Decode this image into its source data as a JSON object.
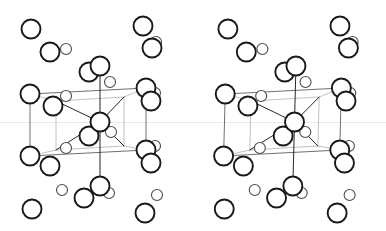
{
  "figure": {
    "width": 386,
    "height": 231,
    "background_color": "#ffffff",
    "line_color": "#1a1a1a",
    "faint_line_color": "#b9b9c2",
    "atom_fill": "#ffffff",
    "atom_stroke": "#1a1a1a"
  },
  "panes": [
    {
      "name": "left-stereo-view",
      "label": "Left eye view",
      "offset_x": 0,
      "offset_y": 0,
      "shear": 0
    },
    {
      "name": "right-stereo-view",
      "label": "Right eye view",
      "offset_x": 193,
      "offset_y": 0,
      "shear": 1
    }
  ],
  "cell": {
    "name": "unit-cell-box",
    "front_face": [
      [
        30,
        94
      ],
      [
        146,
        88
      ],
      [
        146,
        150
      ],
      [
        30,
        156
      ]
    ],
    "back_face": [
      [
        56,
        101
      ],
      [
        124,
        97
      ],
      [
        124,
        146
      ],
      [
        56,
        150
      ]
    ],
    "edges_strong": [
      [
        30,
        94,
        146,
        88
      ],
      [
        30,
        156,
        146,
        150
      ],
      [
        30,
        94,
        30,
        156
      ],
      [
        146,
        88,
        146,
        150
      ]
    ],
    "edges_faint": [
      [
        56,
        101,
        124,
        97
      ],
      [
        56,
        150,
        124,
        146
      ],
      [
        56,
        101,
        56,
        150
      ],
      [
        124,
        97,
        124,
        146
      ],
      [
        30,
        94,
        56,
        101
      ],
      [
        146,
        88,
        124,
        97
      ],
      [
        30,
        156,
        56,
        150
      ],
      [
        146,
        150,
        124,
        146
      ]
    ]
  },
  "bonds": {
    "name": "bond-lines",
    "center": [
      100,
      122
    ],
    "segments": [
      [
        100,
        122,
        56,
        101
      ],
      [
        100,
        122,
        124,
        97
      ],
      [
        100,
        122,
        56,
        150
      ],
      [
        100,
        122,
        124,
        146
      ],
      [
        100,
        122,
        100,
        60
      ],
      [
        100,
        122,
        100,
        186
      ],
      [
        100,
        122,
        88,
        136
      ],
      [
        100,
        122,
        111,
        132
      ]
    ]
  },
  "atoms": {
    "large_radius": 9.5,
    "small_radius": 5.5,
    "large_stroke": 1.9,
    "small_stroke": 1.1,
    "large": [
      {
        "cx": 30,
        "cy": 94,
        "name": "atom-cell-corner-top-left"
      },
      {
        "cx": 146,
        "cy": 88,
        "name": "atom-cell-corner-top-right"
      },
      {
        "cx": 30,
        "cy": 156,
        "name": "atom-cell-corner-bottom-left"
      },
      {
        "cx": 146,
        "cy": 150,
        "name": "atom-cell-corner-bottom-right"
      },
      {
        "cx": 151,
        "cy": 101,
        "name": "atom-right-upper-outer"
      },
      {
        "cx": 151,
        "cy": 163,
        "name": "atom-right-lower-outer"
      },
      {
        "cx": 89,
        "cy": 72,
        "name": "atom-top-cap-left"
      },
      {
        "cx": 100,
        "cy": 66,
        "name": "atom-top-cap-right"
      },
      {
        "cx": 89,
        "cy": 136,
        "name": "atom-interior-lower-left"
      },
      {
        "cx": 100,
        "cy": 122,
        "name": "atom-cell-center"
      },
      {
        "cx": 53,
        "cy": 106,
        "name": "atom-interior-upper-left"
      },
      {
        "cx": 50,
        "cy": 166,
        "name": "atom-below-bottom-left"
      },
      {
        "cx": 100,
        "cy": 186,
        "name": "atom-bottom-stem"
      },
      {
        "cx": 84,
        "cy": 198,
        "name": "atom-bottom-left-free"
      },
      {
        "cx": 31,
        "cy": 29,
        "name": "atom-free-upper-left-1"
      },
      {
        "cx": 50,
        "cy": 52,
        "name": "atom-free-upper-left-2"
      },
      {
        "cx": 143,
        "cy": 26,
        "name": "atom-free-upper-right-1"
      },
      {
        "cx": 152,
        "cy": 48,
        "name": "atom-free-upper-right-2"
      },
      {
        "cx": 32,
        "cy": 209,
        "name": "atom-free-lower-left-1"
      },
      {
        "cx": 145,
        "cy": 213,
        "name": "atom-free-lower-right-1"
      }
    ],
    "small": [
      {
        "cx": 66,
        "cy": 49,
        "name": "atom-small-upper-left"
      },
      {
        "cx": 156,
        "cy": 42,
        "name": "atom-small-upper-right"
      },
      {
        "cx": 110,
        "cy": 82,
        "name": "atom-small-top-inner"
      },
      {
        "cx": 66,
        "cy": 96,
        "name": "atom-small-back-top-left"
      },
      {
        "cx": 155,
        "cy": 93,
        "name": "atom-small-back-top-right"
      },
      {
        "cx": 111,
        "cy": 132,
        "name": "atom-small-center-right"
      },
      {
        "cx": 66,
        "cy": 148,
        "name": "atom-small-back-bottom-left"
      },
      {
        "cx": 155,
        "cy": 146,
        "name": "atom-small-back-bottom-right"
      },
      {
        "cx": 109,
        "cy": 193,
        "name": "atom-small-bottom-stem"
      },
      {
        "cx": 62,
        "cy": 190,
        "name": "atom-small-lower-left"
      },
      {
        "cx": 157,
        "cy": 195,
        "name": "atom-small-lower-right"
      }
    ]
  }
}
